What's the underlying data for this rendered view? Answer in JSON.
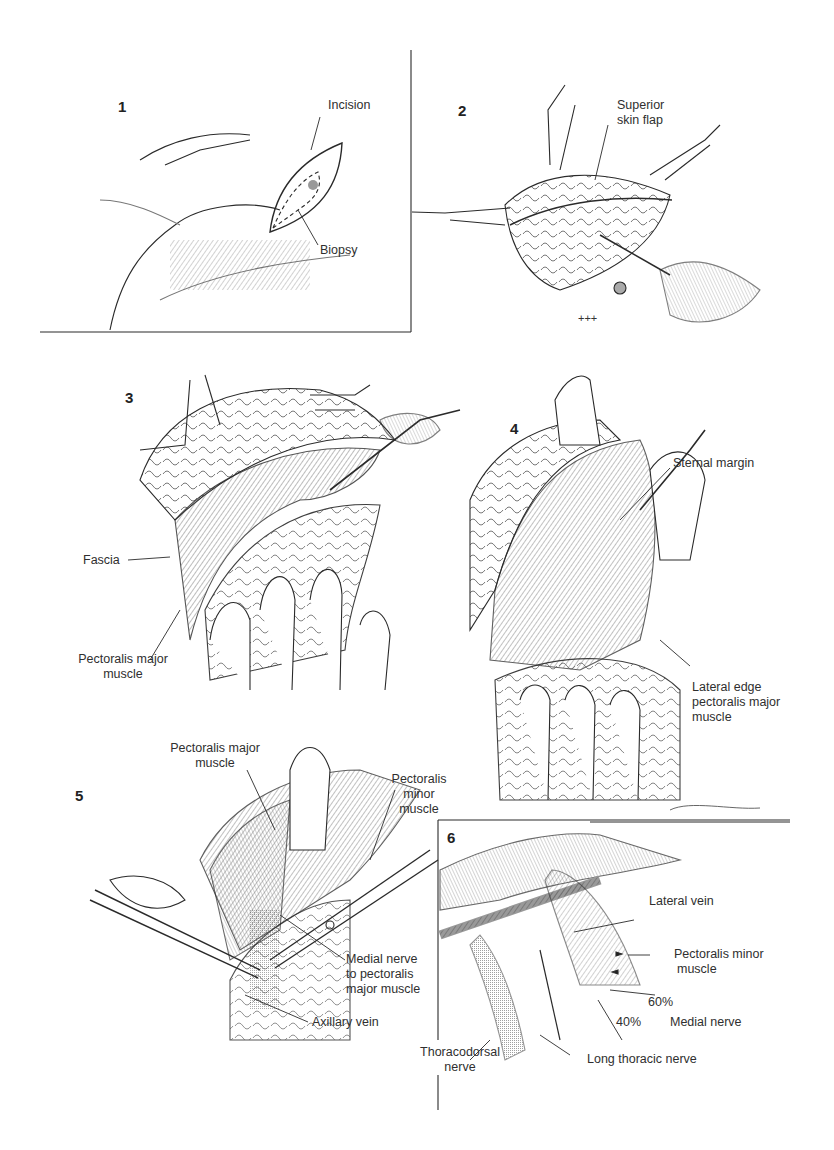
{
  "figure": {
    "signature": "M. Britanna",
    "colors": {
      "ink": "#2a2a2a",
      "hatch": "#6a6a6a",
      "background": "#ffffff"
    }
  },
  "panels": [
    {
      "number": "1",
      "labels": {
        "incision": "Incision",
        "biopsy": "Biopsy"
      }
    },
    {
      "number": "2",
      "labels": {
        "superior_skin_flap_1": "Superior",
        "superior_skin_flap_2": "skin flap"
      }
    },
    {
      "number": "3",
      "labels": {
        "fascia": "Fascia",
        "pectoralis_major_1": "Pectoralis major",
        "pectoralis_major_2": "muscle"
      }
    },
    {
      "number": "4",
      "labels": {
        "sternal_margin": "Sternal margin",
        "lateral_edge_1": "Lateral edge",
        "lateral_edge_2": "pectoralis major",
        "lateral_edge_3": "muscle"
      }
    },
    {
      "number": "5",
      "labels": {
        "pectoralis_major_1": "Pectoralis major",
        "pectoralis_major_2": "muscle",
        "pectoralis_minor_1": "Pectoralis",
        "pectoralis_minor_2": "minor",
        "pectoralis_minor_3": "muscle",
        "medial_nerve_1": "Medial nerve",
        "medial_nerve_2": "to pectoralis",
        "medial_nerve_3": "major muscle",
        "axillary_vein": "Axillary vein"
      }
    },
    {
      "number": "6",
      "labels": {
        "lateral_vein": "Lateral vein",
        "pectoralis_minor_1": "Pectoralis minor",
        "pectoralis_minor_2": "muscle",
        "pct_60": "60%",
        "pct_40": "40%",
        "medial_nerve": "Medial nerve",
        "thoracodorsal_1": "Thoracodorsal",
        "thoracodorsal_2": "nerve",
        "long_thoracic": "Long thoracic nerve"
      }
    }
  ]
}
